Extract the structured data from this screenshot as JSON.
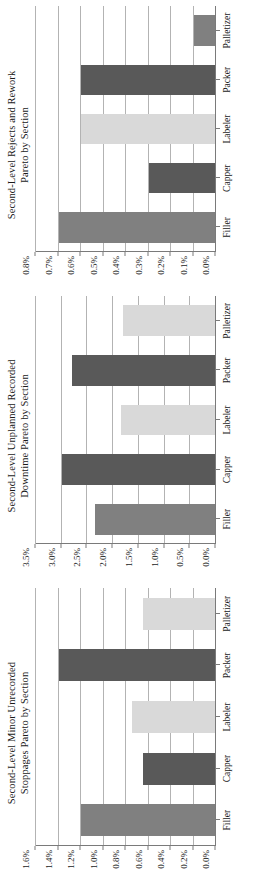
{
  "figure": {
    "orientation": "rotated-90",
    "background": "#ffffff",
    "palette": {
      "dark_gray": "#595959",
      "medium_gray": "#808080",
      "light_gray": "#d9d9d9",
      "gridline": "#b3b3b3",
      "axis": "#7a7a7a",
      "text": "#1a1a1a"
    }
  },
  "charts": [
    {
      "id": "rejects-rework-pareto",
      "title": "Second-Level Rejects and Rework\nPareto by Section",
      "title_line_1": "Second-Level Rejects and Rework",
      "title_line_2": "Pareto by Section",
      "chart_data": {
        "type": "bar",
        "title": "Second-Level Rejects and Rework Pareto by Section",
        "xlabel": "",
        "ylabel": "",
        "categories": [
          "Filler",
          "Capper",
          "Labeler",
          "Packer",
          "Palletizer"
        ],
        "values": [
          0.7,
          0.3,
          0.6,
          0.6,
          0.1
        ],
        "value_unit": "%",
        "ylim": [
          0.0,
          0.8
        ],
        "ticks": [
          "0.0%",
          "0.1%",
          "0.2%",
          "0.3%",
          "0.4%",
          "0.5%",
          "0.6%",
          "0.7%",
          "0.8%"
        ],
        "tick_values": [
          0.0,
          0.1,
          0.2,
          0.3,
          0.4,
          0.5,
          0.6,
          0.7,
          0.8
        ],
        "bar_colors": [
          "#808080",
          "#595959",
          "#d9d9d9",
          "#595959",
          "#808080"
        ],
        "grid": true,
        "legend": "none"
      }
    },
    {
      "id": "unplanned-downtime-pareto",
      "title": "Second-Level Unplanned Recorded\nDowntime Pareto by Section",
      "title_line_1": "Second-Level Unplanned Recorded",
      "title_line_2": "Downtime Pareto by Section",
      "chart_data": {
        "type": "bar",
        "title": "Second-Level Unplanned Recorded Downtime Pareto by Section",
        "xlabel": "",
        "ylabel": "",
        "categories": [
          "Filler",
          "Capper",
          "Labeler",
          "Packer",
          "Palletizer"
        ],
        "values": [
          2.35,
          3.0,
          1.85,
          2.8,
          1.8
        ],
        "value_unit": "%",
        "ylim": [
          0.0,
          3.5
        ],
        "ticks": [
          "0.0%",
          "0.5%",
          "1.0%",
          "1.5%",
          "2.0%",
          "2.5%",
          "3.0%",
          "3.5%"
        ],
        "tick_values": [
          0.0,
          0.5,
          1.0,
          1.5,
          2.0,
          2.5,
          3.0,
          3.5
        ],
        "bar_colors": [
          "#808080",
          "#595959",
          "#d9d9d9",
          "#595959",
          "#d9d9d9"
        ],
        "grid": true,
        "legend": "none"
      }
    },
    {
      "id": "minor-stoppages-pareto",
      "title": "Second-Level Minor Unrecorded\nStoppages Pareto by Section",
      "title_line_1": "Second-Level Minor Unrecorded",
      "title_line_2": "Stoppages Pareto by Section",
      "chart_data": {
        "type": "bar",
        "title": "Second-Level Minor Unrecorded Stoppages Pareto by Section",
        "xlabel": "",
        "ylabel": "",
        "categories": [
          "Filler",
          "Capper",
          "Labeler",
          "Packer",
          "Palletizer"
        ],
        "values": [
          1.2,
          0.65,
          0.75,
          1.4,
          0.65
        ],
        "value_unit": "%",
        "ylim": [
          0.0,
          1.6
        ],
        "ticks": [
          "0.0%",
          "0.2%",
          "0.4%",
          "0.6%",
          "0.8%",
          "1.0%",
          "1.2%",
          "1.4%",
          "1.6%"
        ],
        "tick_values": [
          0.0,
          0.2,
          0.4,
          0.6,
          0.8,
          1.0,
          1.2,
          1.4,
          1.6
        ],
        "bar_colors": [
          "#808080",
          "#595959",
          "#d9d9d9",
          "#595959",
          "#d9d9d9"
        ],
        "grid": true,
        "legend": "none"
      }
    }
  ]
}
